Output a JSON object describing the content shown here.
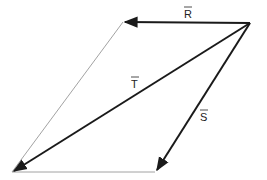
{
  "diagram": {
    "type": "vector-parallelogram",
    "colors": {
      "vector": "#1a1a1a",
      "edge": "#8a8a8a",
      "background": "#ffffff"
    },
    "labels": {
      "R": "R",
      "T": "T",
      "S": "S"
    },
    "points": {
      "origin": [
        250,
        23
      ],
      "r_tip": [
        123,
        22
      ],
      "t_tip": [
        12,
        172
      ],
      "s_tip": [
        155,
        172
      ]
    }
  }
}
